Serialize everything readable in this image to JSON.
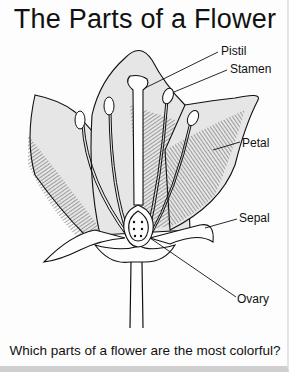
{
  "title": "The Parts of a Flower",
  "labels": {
    "pistil": "Pistil",
    "stamen": "Stamen",
    "petal": "Petal",
    "sepal": "Sepal",
    "ovary": "Ovary"
  },
  "question": "Which parts of a flower are the most colorful?",
  "colors": {
    "petal_fill": "#e6e6e6",
    "line": "#111111",
    "background": "#fdfdfd"
  }
}
